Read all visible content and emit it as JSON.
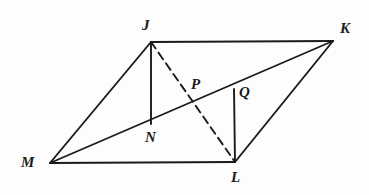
{
  "figure": {
    "kind": "geometry-diagram",
    "background_color": "#fdfdfd",
    "stroke_color": "#1b1b1b",
    "label_color": "#1b1b1b",
    "canvas": {
      "width": 369,
      "height": 195
    },
    "points": {
      "J": {
        "label": "J",
        "x": 151,
        "y": 42
      },
      "K": {
        "label": "K",
        "x": 333,
        "y": 41
      },
      "L": {
        "label": "L",
        "x": 235,
        "y": 162
      },
      "M": {
        "label": "M",
        "x": 50,
        "y": 163
      },
      "N": {
        "label": "N",
        "x": 151,
        "y": 122
      },
      "P": {
        "label": "P",
        "x": 198,
        "y": 100
      },
      "Q": {
        "label": "Q",
        "x": 234,
        "y": 89
      }
    },
    "segments": [
      {
        "name": "side-JK",
        "from": "J",
        "to": "K",
        "style": "solid"
      },
      {
        "name": "side-KL",
        "from": "K",
        "to": "L",
        "style": "solid"
      },
      {
        "name": "side-LM",
        "from": "L",
        "to": "M",
        "style": "solid"
      },
      {
        "name": "side-MJ",
        "from": "M",
        "to": "J",
        "style": "solid"
      },
      {
        "name": "diagonal-MK",
        "from": "M",
        "to": "K",
        "style": "solid"
      },
      {
        "name": "diagonal-JL",
        "from": "J",
        "to": "L",
        "style": "dashed"
      },
      {
        "name": "perpendicular-JN",
        "from": "J",
        "to": "N",
        "style": "solid"
      },
      {
        "name": "perpendicular-QL",
        "from": "Q",
        "to": "L",
        "style": "solid"
      }
    ]
  }
}
